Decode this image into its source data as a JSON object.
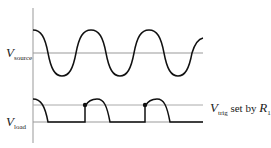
{
  "labels": {
    "source": {
      "main": "V",
      "sub": "source"
    },
    "load": {
      "main": "V",
      "sub": "load"
    },
    "trigger": {
      "main": "V",
      "sub": "trig",
      "text": " set by ",
      "r_main": "R",
      "r_sub": "1"
    }
  },
  "colors": {
    "waveform": "#111111",
    "reference_line": "#999999",
    "axis": "#888888"
  }
}
